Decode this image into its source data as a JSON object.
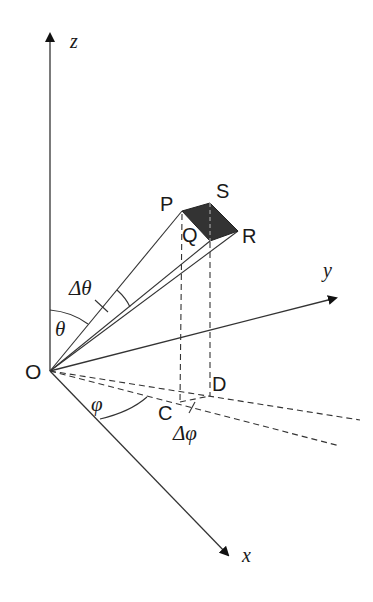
{
  "diagram": {
    "axes": {
      "z": "z",
      "y": "y",
      "x": "x"
    },
    "points": {
      "origin": "O",
      "P": "P",
      "S": "S",
      "Q": "Q",
      "R": "R",
      "C": "C",
      "D": "D"
    },
    "angles": {
      "theta": "θ",
      "delta_theta": "Δθ",
      "phi": "φ",
      "delta_phi": "Δφ"
    },
    "colors": {
      "line": "#222222",
      "patch_fill": "#333333"
    }
  }
}
